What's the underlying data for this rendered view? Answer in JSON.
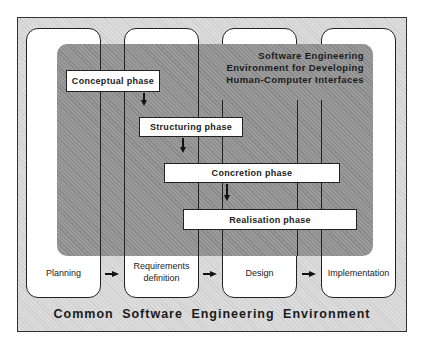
{
  "diagram": {
    "outer_environment": "Common Software Engineering Environment",
    "inner_environment": "Software Engineering\nEnvironment for Developing\nHuman-Computer Interfaces",
    "stages": [
      {
        "label": "Planning"
      },
      {
        "label": "Requirements\ndefinition"
      },
      {
        "label": "Design"
      },
      {
        "label": "Implementation"
      }
    ],
    "phases": [
      {
        "label": "Conceptual  phase"
      },
      {
        "label": "Structuring  phase"
      },
      {
        "label": "Concretion  phase"
      },
      {
        "label": "Realisation  phase"
      }
    ],
    "colors": {
      "outer_background": "#dcdcdc",
      "inner_background": "#9a9a9a",
      "box_fill": "#ffffff",
      "line": "#222222"
    }
  }
}
